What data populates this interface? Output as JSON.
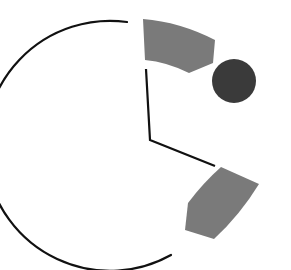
{
  "canvas": {
    "width": 291,
    "height": 270,
    "background": "#ffffff"
  },
  "colors": {
    "stroke": "#111111",
    "segment_fill": "#7a7a7a",
    "dot_fill": "#3a3a3a"
  },
  "clock": {
    "center": [
      150,
      140
    ],
    "outer_arc": {
      "start": [
        127,
        22
      ],
      "end": [
        171,
        255
      ],
      "radius": 125,
      "stroke_width": 2.2
    },
    "hands": [
      {
        "name": "hand-upper",
        "from": [
          146,
          69
        ],
        "to": [
          150,
          140
        ]
      },
      {
        "name": "hand-lower-right",
        "from": [
          150,
          140
        ],
        "to": [
          215,
          166
        ]
      }
    ],
    "segments": [
      {
        "name": "segment-top",
        "path": "M143,19 Q180,22 215,40 L213,63 L189,73 Q167,62 145,60 Z"
      },
      {
        "name": "segment-bottom",
        "path": "M221,167 L259,184 Q240,215 214,239 L185,230 L188,203 Q203,183 221,167 Z"
      }
    ],
    "dot": {
      "cx": 234,
      "cy": 81,
      "r": 22
    }
  }
}
